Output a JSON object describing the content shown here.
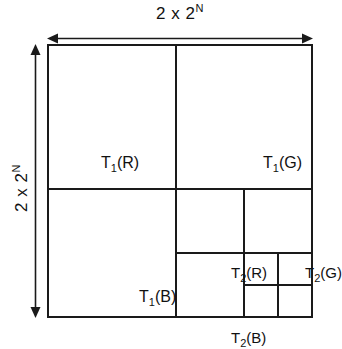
{
  "diagram": {
    "dimension_top": {
      "prefix": "2 x 2",
      "exponent": "N"
    },
    "dimension_left": {
      "prefix": "2 x 2",
      "exponent": "N"
    },
    "cells": [
      {
        "id": "t1r",
        "base": "T",
        "sub": "1",
        "suffix": "(R)"
      },
      {
        "id": "t1g",
        "base": "T",
        "sub": "1",
        "suffix": "(G)"
      },
      {
        "id": "t1b",
        "base": "T",
        "sub": "1",
        "suffix": "(B)"
      },
      {
        "id": "t2r",
        "base": "T",
        "sub": "2",
        "suffix": "(R)"
      },
      {
        "id": "t2g",
        "base": "T",
        "sub": "2",
        "suffix": "(G)"
      },
      {
        "id": "t2b",
        "base": "T",
        "sub": "2",
        "suffix": "(B)"
      }
    ],
    "colors": {
      "line": "#1a1a1a",
      "text": "#111111",
      "background": "#ffffff"
    }
  }
}
